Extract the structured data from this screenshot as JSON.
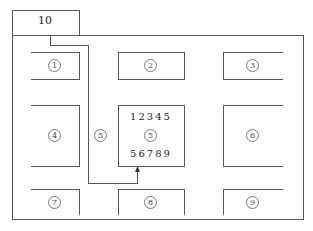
{
  "diagram": {
    "entrance_label": "10",
    "areas": [
      {
        "id": "1",
        "label": "1"
      },
      {
        "id": "2",
        "label": "2"
      },
      {
        "id": "3",
        "label": "3"
      },
      {
        "id": "4",
        "label": "4"
      },
      {
        "id": "5a",
        "label": "5"
      },
      {
        "id": "5b",
        "label": "5"
      },
      {
        "id": "6",
        "label": "6"
      },
      {
        "id": "7",
        "label": "7"
      },
      {
        "id": "8",
        "label": "8"
      },
      {
        "id": "9",
        "label": "9"
      }
    ],
    "center_box": {
      "top_digits": "12345",
      "bottom_digits": "56789"
    },
    "colors": {
      "line": "#555555",
      "background": "#ffffff"
    }
  }
}
